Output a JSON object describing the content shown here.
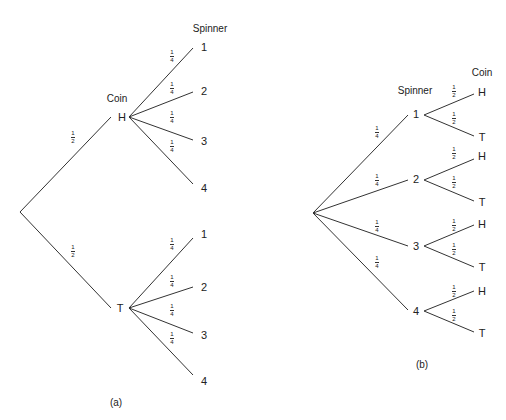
{
  "diagram_a": {
    "caption": "(a)",
    "level1_header": "Coin",
    "level2_header": "Spinner",
    "root": {
      "x": 20,
      "y": 212
    },
    "branches": [
      {
        "label": "H",
        "x": 117,
        "y": 117,
        "prob": {
          "num": "1",
          "den": "2"
        },
        "children": [
          {
            "label": "1",
            "prob": {
              "num": "1",
              "den": "4"
            }
          },
          {
            "label": "2",
            "prob": {
              "num": "1",
              "den": "4"
            }
          },
          {
            "label": "3",
            "prob": {
              "num": "1",
              "den": "4"
            }
          },
          {
            "label": "4",
            "prob": {
              "num": "1",
              "den": "4"
            }
          }
        ]
      },
      {
        "label": "T",
        "x": 117,
        "y": 308,
        "prob": {
          "num": "1",
          "den": "2"
        },
        "children": [
          {
            "label": "1",
            "prob": {
              "num": "1",
              "den": "4"
            }
          },
          {
            "label": "2",
            "prob": {
              "num": "1",
              "den": "4"
            }
          },
          {
            "label": "3",
            "prob": {
              "num": "1",
              "den": "4"
            }
          },
          {
            "label": "4",
            "prob": {
              "num": "1",
              "den": "4"
            }
          }
        ]
      }
    ]
  },
  "diagram_b": {
    "caption": "(b)",
    "level1_header": "Spinner",
    "level2_header": "Coin",
    "branches": [
      {
        "label": "1",
        "prob": {
          "num": "1",
          "den": "4"
        },
        "children": [
          {
            "label": "H",
            "prob": {
              "num": "1",
              "den": "2"
            }
          },
          {
            "label": "T",
            "prob": {
              "num": "1",
              "den": "2"
            }
          }
        ]
      },
      {
        "label": "2",
        "prob": {
          "num": "1",
          "den": "4"
        },
        "children": [
          {
            "label": "H",
            "prob": {
              "num": "1",
              "den": "2"
            }
          },
          {
            "label": "T",
            "prob": {
              "num": "1",
              "den": "2"
            }
          }
        ]
      },
      {
        "label": "3",
        "prob": {
          "num": "1",
          "den": "4"
        },
        "children": [
          {
            "label": "H",
            "prob": {
              "num": "1",
              "den": "2"
            }
          },
          {
            "label": "T",
            "prob": {
              "num": "1",
              "den": "2"
            }
          }
        ]
      },
      {
        "label": "4",
        "prob": {
          "num": "1",
          "den": "4"
        },
        "children": [
          {
            "label": "H",
            "prob": {
              "num": "1",
              "den": "2"
            }
          },
          {
            "label": "T",
            "prob": {
              "num": "1",
              "den": "2"
            }
          }
        ]
      }
    ]
  }
}
